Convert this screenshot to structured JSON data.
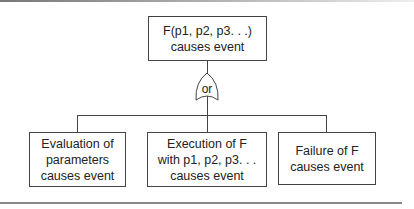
{
  "diagram": {
    "type": "fault-tree",
    "top_event": {
      "lines": [
        "F(p1, p2, p3. . .)",
        "causes event"
      ]
    },
    "gate": {
      "type": "OR",
      "label": "or"
    },
    "children": [
      {
        "lines": [
          "Evaluation of",
          "parameters",
          "causes event"
        ]
      },
      {
        "lines": [
          "Execution of F",
          "with p1, p2, p3. . .",
          "causes event"
        ]
      },
      {
        "lines": [
          "Failure of F",
          "causes event"
        ]
      }
    ]
  },
  "colors": {
    "stroke": "#444444",
    "background": "#ffffff"
  }
}
